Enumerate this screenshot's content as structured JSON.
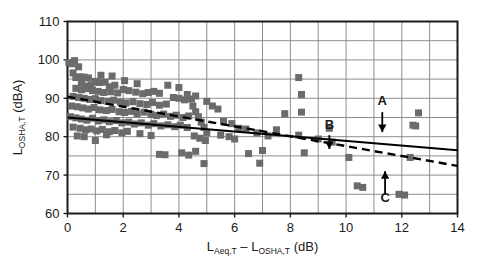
{
  "chart_data": {
    "type": "scatter",
    "title": "",
    "xlabel": "L(Aeq,T) - L(OSHA,T) (dB)",
    "ylabel": "L(OSHA,T) (dBA)",
    "xlabel_parts": {
      "base1": "L",
      "sub1": "Aeq,T",
      "minus": " – ",
      "base2": "L",
      "sub2": "OSHA,T",
      "unit": " (dB)"
    },
    "ylabel_parts": {
      "base": "L",
      "sub": "OSHA,T",
      "unit": " (dBA)"
    },
    "xlim": [
      0,
      14
    ],
    "ylim": [
      60,
      110
    ],
    "xticks": [
      0,
      2,
      4,
      6,
      8,
      10,
      12,
      14
    ],
    "xtick_labels": [
      "0",
      "2",
      "4",
      "6",
      "8",
      "10",
      "12",
      "14"
    ],
    "yticks": [
      60,
      70,
      80,
      90,
      100,
      110
    ],
    "ytick_labels": [
      "60",
      "70",
      "80",
      "90",
      "100",
      "110"
    ],
    "x_minor_step": 1,
    "y_minor_step": 5,
    "grid": true,
    "grid_color": "#808080",
    "frame_color": "#1a1a1a",
    "marker_color": "#6b6b6b",
    "marker_shape": "square",
    "marker_size": 7,
    "legend": null,
    "legend_position": "none",
    "points": [
      [
        0.05,
        99.3
      ],
      [
        0.15,
        99.0
      ],
      [
        0.2,
        96.6
      ],
      [
        0.3,
        95.4
      ],
      [
        0.45,
        95.6
      ],
      [
        0.6,
        95.5
      ],
      [
        0.75,
        95.3
      ],
      [
        0.5,
        94.0
      ],
      [
        0.65,
        93.2
      ],
      [
        0.85,
        93.5
      ],
      [
        1.0,
        94.4
      ],
      [
        1.15,
        94.1
      ],
      [
        1.35,
        94.2
      ],
      [
        1.5,
        93.0
      ],
      [
        1.7,
        93.4
      ],
      [
        0.3,
        92.6
      ],
      [
        0.5,
        92.2
      ],
      [
        0.7,
        92.5
      ],
      [
        0.9,
        92.0
      ],
      [
        1.1,
        91.8
      ],
      [
        1.3,
        91.5
      ],
      [
        1.55,
        91.7
      ],
      [
        1.8,
        91.4
      ],
      [
        2.0,
        92.3
      ],
      [
        2.2,
        92.0
      ],
      [
        2.45,
        91.6
      ],
      [
        2.7,
        91.2
      ],
      [
        2.9,
        91.5
      ],
      [
        3.1,
        91.8
      ],
      [
        3.3,
        91.3
      ],
      [
        0.2,
        90.5
      ],
      [
        0.4,
        90.2
      ],
      [
        0.6,
        90.0
      ],
      [
        0.8,
        89.7
      ],
      [
        1.0,
        89.9
      ],
      [
        1.2,
        89.4
      ],
      [
        1.45,
        89.2
      ],
      [
        1.65,
        89.5
      ],
      [
        1.9,
        89.0
      ],
      [
        2.1,
        88.8
      ],
      [
        2.35,
        89.1
      ],
      [
        2.6,
        88.6
      ],
      [
        2.85,
        88.4
      ],
      [
        3.05,
        88.9
      ],
      [
        3.3,
        88.2
      ],
      [
        3.55,
        88.5
      ],
      [
        3.8,
        90.2
      ],
      [
        4.0,
        90.0
      ],
      [
        4.2,
        89.6
      ],
      [
        4.45,
        89.8
      ],
      [
        0.15,
        88.0
      ],
      [
        0.35,
        87.8
      ],
      [
        0.55,
        87.5
      ],
      [
        0.75,
        87.2
      ],
      [
        0.95,
        87.6
      ],
      [
        1.15,
        87.0
      ],
      [
        1.4,
        86.8
      ],
      [
        1.6,
        87.1
      ],
      [
        1.85,
        86.5
      ],
      [
        2.05,
        86.3
      ],
      [
        2.3,
        86.6
      ],
      [
        2.5,
        86.0
      ],
      [
        2.75,
        86.4
      ],
      [
        3.0,
        85.8
      ],
      [
        3.2,
        85.5
      ],
      [
        3.45,
        85.9
      ],
      [
        3.7,
        85.3
      ],
      [
        3.9,
        85.6
      ],
      [
        4.15,
        85.0
      ],
      [
        4.35,
        85.4
      ],
      [
        0.1,
        85.2
      ],
      [
        0.3,
        84.9
      ],
      [
        0.5,
        84.6
      ],
      [
        0.7,
        84.3
      ],
      [
        0.9,
        84.8
      ],
      [
        1.1,
        84.1
      ],
      [
        1.3,
        84.4
      ],
      [
        1.5,
        83.9
      ],
      [
        1.75,
        84.2
      ],
      [
        1.95,
        83.6
      ],
      [
        2.2,
        83.8
      ],
      [
        2.4,
        83.3
      ],
      [
        2.65,
        83.6
      ],
      [
        2.9,
        83.0
      ],
      [
        3.1,
        83.4
      ],
      [
        3.35,
        82.8
      ],
      [
        3.6,
        83.1
      ],
      [
        3.85,
        82.6
      ],
      [
        4.05,
        83.0
      ],
      [
        4.3,
        82.4
      ],
      [
        0.2,
        82.5
      ],
      [
        0.45,
        82.2
      ],
      [
        0.65,
        81.8
      ],
      [
        0.85,
        82.0
      ],
      [
        1.05,
        81.5
      ],
      [
        1.25,
        81.9
      ],
      [
        1.5,
        81.3
      ],
      [
        1.7,
        81.6
      ],
      [
        1.95,
        81.0
      ],
      [
        2.15,
        81.4
      ],
      [
        4.5,
        88.0
      ],
      [
        4.6,
        86.5
      ],
      [
        4.7,
        85.2
      ],
      [
        4.8,
        83.8
      ],
      [
        4.9,
        82.4
      ],
      [
        5.0,
        81.0
      ],
      [
        4.55,
        80.2
      ],
      [
        4.75,
        79.6
      ],
      [
        4.95,
        79.0
      ],
      [
        0.35,
        80.2
      ],
      [
        0.6,
        80.0
      ],
      [
        1.0,
        79.0
      ],
      [
        1.4,
        80.5
      ],
      [
        2.6,
        80.8
      ],
      [
        3.0,
        80.3
      ],
      [
        3.3,
        75.4
      ],
      [
        3.5,
        75.3
      ],
      [
        4.1,
        75.8
      ],
      [
        4.35,
        75.2
      ],
      [
        4.6,
        76.2
      ],
      [
        4.9,
        73.0
      ],
      [
        5.2,
        88.0
      ],
      [
        5.4,
        87.2
      ],
      [
        5.6,
        84.0
      ],
      [
        5.9,
        83.4
      ],
      [
        5.5,
        80.4
      ],
      [
        5.8,
        80.0
      ],
      [
        6.0,
        79.4
      ],
      [
        6.15,
        82.2
      ],
      [
        6.4,
        82.0
      ],
      [
        6.5,
        75.6
      ],
      [
        6.8,
        81.0
      ],
      [
        7.0,
        76.4
      ],
      [
        6.9,
        73.1
      ],
      [
        7.2,
        80.2
      ],
      [
        7.5,
        81.8
      ],
      [
        7.8,
        86.0
      ],
      [
        8.3,
        95.4
      ],
      [
        8.4,
        91.0
      ],
      [
        8.4,
        86.4
      ],
      [
        8.3,
        80.4
      ],
      [
        8.5,
        75.8
      ],
      [
        9.0,
        79.4
      ],
      [
        9.4,
        82.2
      ],
      [
        9.5,
        78.6
      ],
      [
        10.1,
        74.6
      ],
      [
        10.4,
        67.2
      ],
      [
        10.6,
        66.8
      ],
      [
        11.9,
        65.0
      ],
      [
        12.1,
        64.8
      ],
      [
        12.3,
        74.6
      ],
      [
        12.4,
        83.0
      ],
      [
        12.5,
        82.8
      ],
      [
        12.6,
        86.2
      ],
      [
        0.25,
        99.8
      ],
      [
        0.4,
        98.2
      ],
      [
        1.2,
        96.0
      ],
      [
        1.6,
        95.8
      ],
      [
        2.05,
        94.6
      ],
      [
        2.5,
        93.8
      ],
      [
        3.6,
        93.4
      ],
      [
        4.0,
        92.8
      ],
      [
        4.3,
        91.0
      ],
      [
        4.6,
        90.6
      ],
      [
        5.0,
        89.2
      ]
    ],
    "trend_lines": [
      {
        "name": "solid-regression-line",
        "style": "solid",
        "color": "#000000",
        "width": 2,
        "x_start": 0,
        "y_start": 85.0,
        "x_end": 14,
        "y_end": 76.5
      },
      {
        "name": "dashed-regression-line",
        "style": "dashed",
        "color": "#000000",
        "width": 2.4,
        "x_start": 0,
        "y_start": 90.4,
        "x_end": 14,
        "y_end": 72.4
      }
    ],
    "annotations": [
      {
        "label": "A",
        "x": 11.3,
        "label_y": 88.2,
        "arrow_from_y": 86.4,
        "arrow_to_y": 81.2,
        "direction": "down"
      },
      {
        "label": "B",
        "x": 9.4,
        "label_y": 82.1,
        "arrow_from_y": 80.4,
        "arrow_to_y": 76.8,
        "direction": "down"
      },
      {
        "label": "C",
        "x": 11.4,
        "label_y": 63.1,
        "arrow_from_y": 65.0,
        "arrow_to_y": 71.0,
        "direction": "up"
      }
    ]
  }
}
